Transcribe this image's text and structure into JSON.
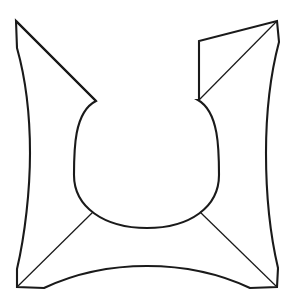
{
  "figure": {
    "title": "Concave star-cushion outline with central U-shaped cup",
    "kind": "line-drawing",
    "background_color": "#ffffff",
    "stroke_color": "#1a1a1a",
    "fill_color": "#ffffff",
    "outline_stroke_width": 2.1,
    "fold_stroke_width": 1.25,
    "canvas": {
      "width": 293,
      "height": 306
    },
    "geometry": {
      "corners": {
        "top_left_tip": [
          16,
          21
        ],
        "top_left_notch_end": [
          17,
          48
        ],
        "top_right_tip": [
          277,
          21
        ],
        "top_right_notch_end": [
          279,
          42
        ],
        "bottom_left_tip": [
          17,
          287
        ],
        "bottom_left_notch_up": [
          17,
          269
        ],
        "bottom_left_notch_right": [
          44,
          288
        ],
        "bottom_right_tip": [
          277,
          287
        ],
        "bottom_right_notch_up": [
          278,
          268
        ],
        "bottom_right_notch_left": [
          250,
          288
        ]
      },
      "cup": {
        "left_rim": [
          96,
          101
        ],
        "right_rim": [
          198,
          100
        ],
        "left_base_junction": [
          93,
          212
        ],
        "right_base_junction": [
          200,
          212
        ],
        "bottom_center": [
          147,
          228
        ],
        "widest_left_x": 74,
        "widest_right_x": 219
      },
      "edges": {
        "left_edge_bulge_x": 30,
        "right_edge_bulge_x": 266,
        "bottom_edge_peak_y": 266,
        "top_right_inner_vertical_x": 199,
        "top_right_inner_vertical_y_range": [
          41,
          100
        ]
      },
      "fold_lines": [
        {
          "name": "top-left-diagonal",
          "from": [
            16,
            21
          ],
          "to": [
            96,
            101
          ]
        },
        {
          "name": "top-right-diagonal",
          "from": [
            277,
            21
          ],
          "to": [
            199,
            100
          ]
        },
        {
          "name": "bottom-left-diagonal",
          "from": [
            17,
            287
          ],
          "to": [
            93,
            212
          ]
        },
        {
          "name": "bottom-right-diagonal",
          "from": [
            277,
            287
          ],
          "to": [
            200,
            212
          ]
        }
      ]
    },
    "outline_path": "M 16 21 L 17 48 C 26 80 30 118 30 153 C 30 190 25 235 17 269 L 17 287 L 44 288 C 78 272 112 266 147 266 C 182 266 216 272 250 288 L 277 287 L 278 268 C 270 234 266 190 266 153 C 266 118 270 76 279 42 L 277 21 L 199 41 L 199 100 C 198 106 197 100 198 100 C 219 112 219 150 219 175 C 219 207 190 228 147 228 C 104 228 74 207 74 175 C 74 150 74 112 96 101 L 16 21 Z",
    "outer_silhouette_path": "M 16 21 L 17 48 C 26 80 30 118 30 153 C 30 190 25 235 17 269 L 17 287 L 44 288 C 78 272 112 266 147 266 C 182 266 216 272 250 288 L 277 287 L 278 268 C 270 234 266 190 266 153 C 266 118 270 76 279 42 L 277 21 L 199 41 L 199 100 L 198 100 C 219 112 219 150 219 175 C 219 207 190 228 147 228 C 104 228 74 207 74 175 C 74 150 74 112 96 101 L 16 21 Z"
  }
}
